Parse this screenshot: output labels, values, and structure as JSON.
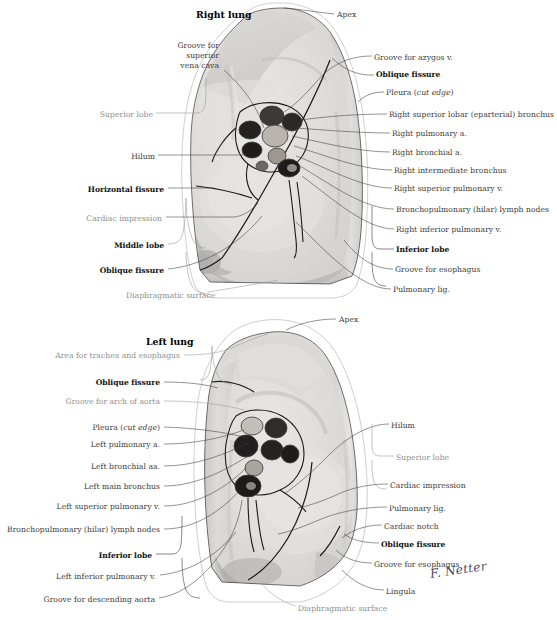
{
  "figure": {
    "kind": "anatomical-illustration",
    "signature": "F. Netter"
  },
  "right_lung": {
    "title": "Right lung",
    "labels_left": [
      {
        "id": "groove-superior-vena-cava",
        "text": "Groove for\nsuperior\nvena cava",
        "style": "plain"
      },
      {
        "id": "superior-lobe",
        "text": "Superior lobe",
        "style": "grey"
      },
      {
        "id": "hilum",
        "text": "Hilum",
        "style": "plain"
      },
      {
        "id": "horizontal-fissure",
        "text": "Horizontal fissure",
        "style": "bold"
      },
      {
        "id": "cardiac-impression",
        "text": "Cardiac impression",
        "style": "grey"
      },
      {
        "id": "middle-lobe",
        "text": "Middle lobe",
        "style": "bold"
      },
      {
        "id": "oblique-fissure",
        "text": "Oblique fissure",
        "style": "bold"
      },
      {
        "id": "diaphragmatic-surface",
        "text": "Diaphragmatic surface",
        "style": "grey"
      }
    ],
    "labels_right": [
      {
        "id": "apex",
        "text": "Apex",
        "style": "plain"
      },
      {
        "id": "groove-azygos",
        "text": "Groove for azygos v.",
        "style": "plain"
      },
      {
        "id": "oblique-fissure",
        "text": "Oblique fissure",
        "style": "bold"
      },
      {
        "id": "pleura-cut-edge",
        "text": "Pleura (cut edge)",
        "style": "italic-part",
        "italic": "cut edge"
      },
      {
        "id": "right-superior-lobar-bronchus",
        "text": "Right superior lobar (eparterial) bronchus",
        "style": "plain"
      },
      {
        "id": "right-pulmonary-a",
        "text": "Right pulmonary a.",
        "style": "plain"
      },
      {
        "id": "right-bronchial-a",
        "text": "Right bronchial a.",
        "style": "plain"
      },
      {
        "id": "right-intermediate-bronchus",
        "text": "Right intermediate bronchus",
        "style": "plain"
      },
      {
        "id": "right-superior-pulmonary-v",
        "text": "Right superior pulmonary v.",
        "style": "plain"
      },
      {
        "id": "bronchopulmonary-lymph-nodes",
        "text": "Bronchopulmonary (hilar) lymph nodes",
        "style": "plain"
      },
      {
        "id": "right-inferior-pulmonary-v",
        "text": "Right inferior pulmonary v.",
        "style": "plain"
      },
      {
        "id": "inferior-lobe",
        "text": "Inferior lobe",
        "style": "bold"
      },
      {
        "id": "groove-esophagus",
        "text": "Groove for esophagus",
        "style": "plain"
      },
      {
        "id": "pulmonary-lig",
        "text": "Pulmonary lig.",
        "style": "plain"
      }
    ]
  },
  "left_lung": {
    "title": "Left lung",
    "labels_left": [
      {
        "id": "area-trachea-esophagus",
        "text": "Area for trachea and esophagus",
        "style": "grey"
      },
      {
        "id": "oblique-fissure",
        "text": "Oblique fissure",
        "style": "bold"
      },
      {
        "id": "groove-arch-aorta",
        "text": "Groove for arch of aorta",
        "style": "grey"
      },
      {
        "id": "pleura-cut-edge",
        "text": "Pleura (cut edge)",
        "style": "italic-part",
        "italic": "cut edge"
      },
      {
        "id": "left-pulmonary-a",
        "text": "Left pulmonary a.",
        "style": "plain"
      },
      {
        "id": "left-bronchial-aa",
        "text": "Left bronchial aa.",
        "style": "plain"
      },
      {
        "id": "left-main-bronchus",
        "text": "Left main bronchus",
        "style": "plain"
      },
      {
        "id": "left-superior-pulmonary-v",
        "text": "Left superior pulmonary v.",
        "style": "plain"
      },
      {
        "id": "bronchopulmonary-lymph-nodes",
        "text": "Bronchopulmonary (hilar) lymph nodes",
        "style": "plain"
      },
      {
        "id": "inferior-lobe",
        "text": "Inferior lobe",
        "style": "bold"
      },
      {
        "id": "left-inferior-pulmonary-v",
        "text": "Left inferior pulmonary v.",
        "style": "plain"
      },
      {
        "id": "groove-descending-aorta",
        "text": "Groove for descending aorta",
        "style": "plain"
      }
    ],
    "labels_right": [
      {
        "id": "apex",
        "text": "Apex",
        "style": "plain"
      },
      {
        "id": "hilum",
        "text": "Hilum",
        "style": "plain"
      },
      {
        "id": "superior-lobe",
        "text": "Superior lobe",
        "style": "grey"
      },
      {
        "id": "cardiac-impression",
        "text": "Cardiac impression",
        "style": "plain"
      },
      {
        "id": "pulmonary-lig",
        "text": "Pulmonary lig.",
        "style": "plain"
      },
      {
        "id": "cardiac-notch",
        "text": "Cardiac notch",
        "style": "plain"
      },
      {
        "id": "oblique-fissure",
        "text": "Oblique fissure",
        "style": "bold"
      },
      {
        "id": "groove-esophagus",
        "text": "Groove for esophagus",
        "style": "plain"
      },
      {
        "id": "lingula",
        "text": "Lingula",
        "style": "plain"
      }
    ],
    "labels_bottom": [
      {
        "id": "diaphragmatic-surface",
        "text": "Diaphragmatic surface",
        "style": "grey"
      }
    ]
  },
  "colors": {
    "ink": "#3a3a3a",
    "bold_ink": "#111111",
    "grey_label": "#8d8d8d",
    "leader": "#3b3b3b",
    "pleura": "#b9b9b9",
    "lung_light": "#cfcbc6",
    "lung_mid": "#a9a49e",
    "lung_dark": "#7b766f",
    "vessel_dark": "#2e2b28",
    "background": "#ffffff"
  }
}
